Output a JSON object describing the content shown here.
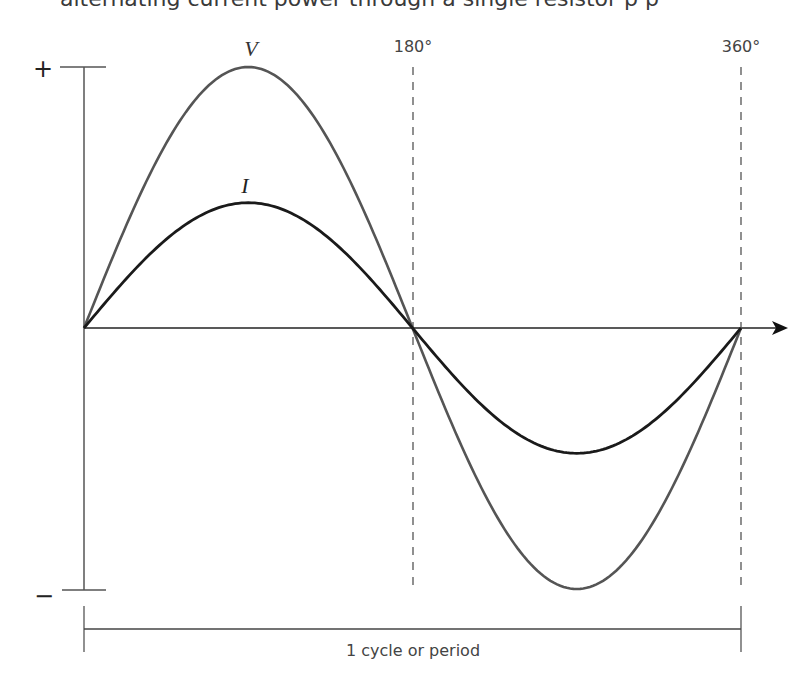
{
  "clipped_text": "alternating current power through a single resistor p p",
  "diagram": {
    "title": "",
    "axis": {
      "positive_label": "+",
      "negative_label": "−",
      "horizontal_direction": "right-arrow"
    },
    "markers": [
      {
        "label": "180°",
        "x_degrees": 180
      },
      {
        "label": "360°",
        "x_degrees": 360
      }
    ],
    "curves": [
      {
        "label": "V",
        "amplitude_ratio": 1.0,
        "color": "#555555"
      },
      {
        "label": "I",
        "amplitude_ratio": 0.48,
        "color": "#1a1a1a"
      }
    ],
    "period_label": "1 cycle or period"
  },
  "chart_data": {
    "type": "line",
    "title": "",
    "xlabel": "",
    "ylabel": "",
    "x_ticks": [
      "180°",
      "360°"
    ],
    "x": [
      0,
      45,
      90,
      135,
      180,
      225,
      270,
      315,
      360
    ],
    "series": [
      {
        "name": "V",
        "values": [
          0,
          0.707,
          1.0,
          0.707,
          0,
          -0.707,
          -1.0,
          -0.707,
          0
        ]
      },
      {
        "name": "I",
        "values": [
          0,
          0.34,
          0.48,
          0.34,
          0,
          -0.34,
          -0.48,
          -0.34,
          0
        ]
      }
    ],
    "ylim": [
      -1,
      1
    ],
    "y_labels": {
      "top": "+",
      "bottom": "−"
    },
    "annotation": "1 cycle or period",
    "grid": false
  }
}
